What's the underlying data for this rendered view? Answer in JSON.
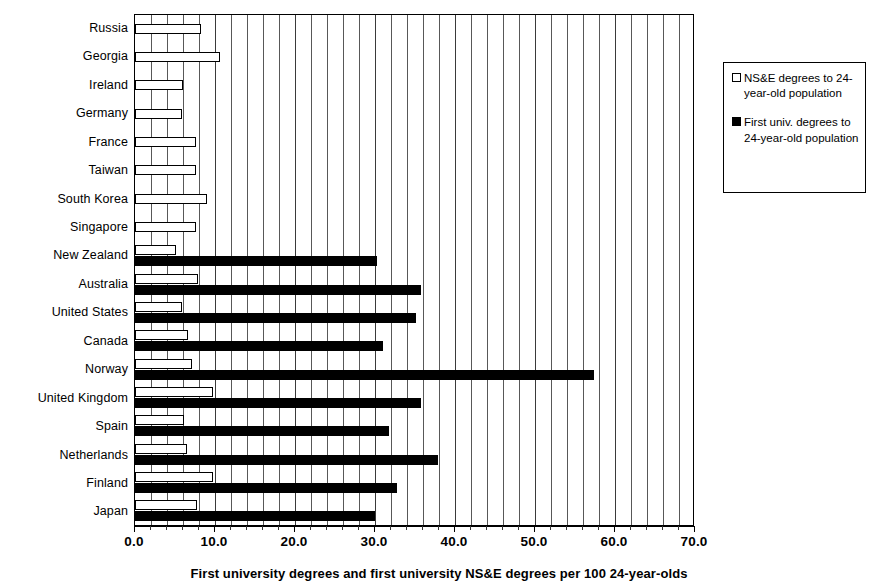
{
  "chart_data": {
    "type": "bar",
    "orientation": "horizontal",
    "title": "",
    "caption": "First university degrees and first university NS&E degrees per 100 24-year-olds",
    "xlabel": "",
    "ylabel": "",
    "xlim": [
      0.0,
      70.0
    ],
    "xticks": [
      "0.0",
      "10.0",
      "20.0",
      "30.0",
      "40.0",
      "50.0",
      "60.0",
      "70.0"
    ],
    "xtick_values": [
      0,
      10,
      20,
      30,
      40,
      50,
      60,
      70
    ],
    "minor_tick_step": 2,
    "grid": true,
    "grid_axis": "x",
    "legend_position": "right",
    "categories": [
      "Russia",
      "Georgia",
      "Ireland",
      "Germany",
      "France",
      "Taiwan",
      "South Korea",
      "Singapore",
      "New Zealand",
      "Australia",
      "United States",
      "Canada",
      "Norway",
      "United Kingdom",
      "Spain",
      "Netherlands",
      "Finland",
      "Japan"
    ],
    "series": [
      {
        "name": "NS&E degrees to 24-year-old population",
        "fill": "#ffffff",
        "edge": "#000000",
        "values": [
          8.2,
          10.6,
          6.0,
          5.9,
          7.6,
          7.6,
          9.0,
          7.6,
          5.1,
          7.9,
          5.9,
          6.6,
          7.1,
          9.8,
          6.1,
          6.5,
          9.8,
          7.8
        ]
      },
      {
        "name": "First univ. degrees to 24-year-old population",
        "fill": "#000000",
        "edge": "#000000",
        "values": [
          0,
          0,
          0,
          0,
          0,
          0,
          0,
          0,
          30.3,
          35.8,
          35.1,
          31.0,
          57.4,
          35.7,
          31.7,
          37.9,
          32.7,
          30.0
        ]
      }
    ]
  },
  "legend": {
    "entries": [
      {
        "swatch": "open-square",
        "label": "NS&E degrees to 24-year-old population"
      },
      {
        "swatch": "filled-square",
        "label": "First univ. degrees to 24-year-old population"
      }
    ]
  }
}
